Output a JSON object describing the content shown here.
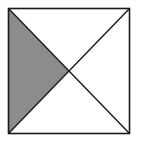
{
  "diagram": {
    "type": "geometry",
    "square": {
      "x": 8.5,
      "y": 8.5,
      "width": 121,
      "height": 125
    },
    "center": {
      "x": 69,
      "y": 71
    },
    "shaded_region": "left-triangle",
    "colors": {
      "background": "#ffffff",
      "stroke": "#1a1a1a",
      "shade": "#8c8c8c"
    },
    "labels": []
  }
}
